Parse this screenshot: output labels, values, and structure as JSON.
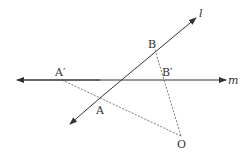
{
  "diagram": {
    "title": "",
    "colors": {
      "line": "#333333",
      "dashed": "#555555",
      "background": "#ffffff"
    },
    "lines": [
      {
        "id": "l",
        "label": "l",
        "type": "line-with-arrows",
        "from": [
          70,
          124
        ],
        "to": [
          196,
          18
        ]
      },
      {
        "id": "m",
        "label": "m",
        "type": "line-with-arrows",
        "from": [
          17,
          80
        ],
        "to": [
          232,
          80
        ]
      }
    ],
    "segments": [
      {
        "from": "A'",
        "to": "O",
        "style": "dashed"
      },
      {
        "from": "B",
        "to": "O",
        "style": "dashed"
      }
    ],
    "points": [
      {
        "name": "A",
        "label": "A",
        "x": 100,
        "y": 98
      },
      {
        "name": "B",
        "label": "B",
        "x": 155,
        "y": 50
      },
      {
        "name": "A'",
        "label": "A′",
        "x": 62,
        "y": 80
      },
      {
        "name": "B'",
        "label": "B′",
        "x": 163,
        "y": 80
      },
      {
        "name": "O",
        "label": "O",
        "x": 181,
        "y": 136
      }
    ],
    "labels": {
      "l": "l",
      "m": "m",
      "A": "A",
      "B": "B",
      "A_prime": "A′",
      "B_prime": "B′",
      "O": "O"
    }
  }
}
